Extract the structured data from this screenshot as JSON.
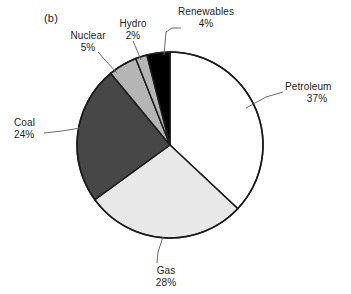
{
  "figure": {
    "panel_tag": "(b)",
    "background": "#ffffff",
    "outline_color": "#1c1c1c"
  },
  "chart_data": {
    "type": "pie",
    "title": "",
    "xlabel": "",
    "ylabel": "",
    "legend_position": "none",
    "grid": false,
    "start_angle_deg": 0,
    "direction": "clockwise",
    "categories": [
      "Petroleum",
      "Gas",
      "Coal",
      "Nuclear",
      "Hydro",
      "Renewables"
    ],
    "values": [
      37,
      28,
      24,
      5,
      2,
      4
    ],
    "value_unit": "%",
    "slices": [
      {
        "label": "Petroleum",
        "value": 37,
        "value_text": "37%",
        "color": "#ffffff",
        "start_deg": 0,
        "end_deg": 133.2,
        "leader": true
      },
      {
        "label": "Gas",
        "value": 28,
        "value_text": "28%",
        "color": "#e8e8e8",
        "start_deg": 133.2,
        "end_deg": 234.0,
        "leader": true
      },
      {
        "label": "Coal",
        "value": 24,
        "value_text": "24%",
        "color": "#474747",
        "start_deg": 234.0,
        "end_deg": 320.4,
        "leader": true
      },
      {
        "label": "Nuclear",
        "value": 5,
        "value_text": "5%",
        "color": "#b5b5b5",
        "start_deg": 320.4,
        "end_deg": 338.4,
        "leader": true
      },
      {
        "label": "Hydro",
        "value": 2,
        "value_text": "2%",
        "color": "#b5b5b5",
        "start_deg": 338.4,
        "end_deg": 345.6,
        "leader": true
      },
      {
        "label": "Renewables",
        "value": 4,
        "value_text": "4%",
        "color": "#000000",
        "start_deg": 345.6,
        "end_deg": 360.0,
        "leader": true
      }
    ]
  }
}
